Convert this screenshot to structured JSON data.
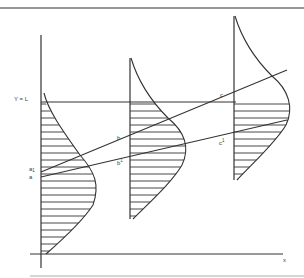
{
  "diagram": {
    "title": "",
    "labels": {
      "y_equals_L": "Y = L",
      "x_axis": "x",
      "a": "a",
      "a1": "a",
      "a1_sup": "1",
      "b": "b",
      "b1": "b",
      "b1_sup": "1",
      "c": "c",
      "c1": "c",
      "c1_sup": "1"
    },
    "distributions": [
      {
        "name": "distribution-1",
        "axis_x": 41,
        "top_y": 93,
        "peak_x": 97,
        "peak_y": 180,
        "bottom_y": 254,
        "shaded_from_y": 102
      },
      {
        "name": "distribution-2",
        "axis_x": 130,
        "top_y": 58,
        "peak_x": 186,
        "peak_y": 143,
        "bottom_y": 219,
        "shaded_from_y": 102
      },
      {
        "name": "distribution-3",
        "axis_x": 234,
        "top_y": 16,
        "peak_x": 290,
        "peak_y": 100,
        "bottom_y": 180,
        "shaded_from_y": 102
      }
    ],
    "lines": {
      "threshold_y": 102,
      "upper_trend": {
        "from": [
          41,
          172
        ],
        "to": [
          287,
          70
        ],
        "points": [
          "a1",
          "b",
          "c"
        ]
      },
      "lower_trend": {
        "from": [
          41,
          177
        ],
        "to": [
          287,
          120
        ],
        "points": [
          "a",
          "b1",
          "c1"
        ]
      }
    },
    "colors": {
      "ink": "#333333",
      "background": "#ffffff"
    }
  }
}
